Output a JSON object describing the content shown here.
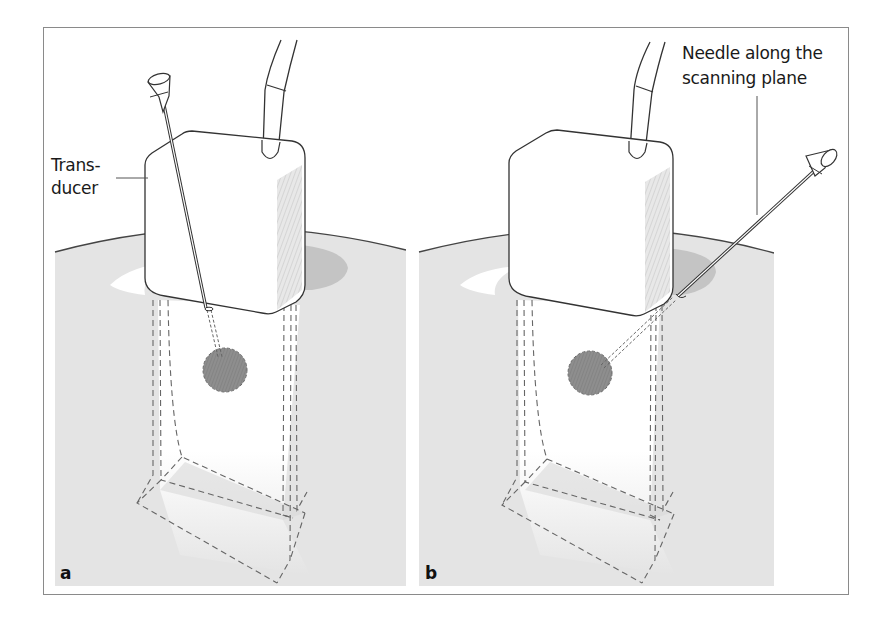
{
  "figure": {
    "panels": [
      {
        "id": "a",
        "letter": "a"
      },
      {
        "id": "b",
        "letter": "b"
      }
    ],
    "labels": {
      "transducer_line1": "Trans-",
      "transducer_line2": "ducer",
      "needle_line1": "Needle along the",
      "needle_line2": "scanning plane"
    },
    "colors": {
      "frame": "#8a8a8a",
      "panel_bg": "#e4e4e4",
      "skin_dark": "#cfcfcf",
      "lesion": "#8c8c8c",
      "outline": "#333333",
      "dash": "#666666"
    }
  }
}
